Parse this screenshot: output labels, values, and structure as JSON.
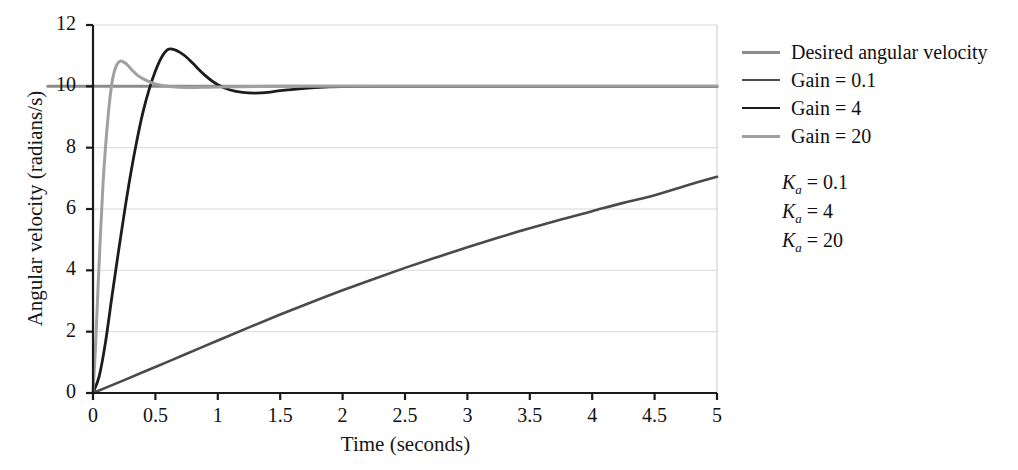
{
  "chart_data": {
    "type": "line",
    "title": "",
    "xlabel": "Time (seconds)",
    "ylabel": "Angular velocity (radians/s)",
    "xlim": [
      0,
      5
    ],
    "ylim": [
      0,
      12
    ],
    "xticks": [
      "0",
      "0.5",
      "1",
      "1.5",
      "2",
      "2.5",
      "3",
      "3.5",
      "4",
      "4.5",
      "5"
    ],
    "yticks": [
      "0",
      "2",
      "4",
      "6",
      "8",
      "10",
      "12"
    ],
    "grid": true,
    "grid_axis": "y",
    "legend_position": "right",
    "series": [
      {
        "name": "Desired angular velocity",
        "color": "#8c8c8c",
        "width": 3.0,
        "x": [
          0,
          0.01,
          5
        ],
        "values": [
          10,
          10,
          10
        ]
      },
      {
        "name": "Gain = 0.1",
        "color": "#4a4a4a",
        "width": 2.6,
        "x": [
          0,
          0.25,
          0.5,
          0.75,
          1,
          1.25,
          1.5,
          1.75,
          2,
          2.25,
          2.5,
          2.75,
          3,
          3.25,
          3.5,
          3.75,
          4,
          4.25,
          4.5,
          4.75,
          5
        ],
        "values": [
          0,
          0.42,
          0.85,
          1.28,
          1.71,
          2.14,
          2.56,
          2.96,
          3.35,
          3.72,
          4.08,
          4.42,
          4.75,
          5.07,
          5.37,
          5.66,
          5.93,
          6.2,
          6.45,
          6.76,
          7.05
        ]
      },
      {
        "name": "Gain = 4",
        "color": "#1c1c1c",
        "width": 2.8,
        "x": [
          0,
          0.05,
          0.1,
          0.15,
          0.2,
          0.25,
          0.3,
          0.35,
          0.4,
          0.45,
          0.5,
          0.55,
          0.6,
          0.65,
          0.7,
          0.75,
          0.8,
          0.9,
          1,
          1.1,
          1.2,
          1.3,
          1.4,
          1.5,
          1.6,
          1.75,
          2,
          2.5,
          3,
          4,
          5
        ],
        "values": [
          0,
          0.55,
          1.65,
          3.1,
          4.5,
          5.85,
          7.1,
          8.2,
          9.15,
          9.9,
          10.5,
          10.95,
          11.2,
          11.2,
          11.1,
          10.95,
          10.75,
          10.35,
          10.05,
          9.88,
          9.8,
          9.78,
          9.8,
          9.86,
          9.9,
          9.95,
          9.99,
          10.0,
          10.0,
          10.0,
          10.0
        ]
      },
      {
        "name": "Gain = 20",
        "color": "#a0a0a0",
        "width": 3.0,
        "x": [
          0,
          0.02,
          0.04,
          0.06,
          0.08,
          0.1,
          0.13,
          0.16,
          0.19,
          0.22,
          0.25,
          0.28,
          0.32,
          0.36,
          0.4,
          0.45,
          0.5,
          0.6,
          0.7,
          0.8,
          0.9,
          1.0,
          1.2,
          1.5,
          2,
          3,
          4,
          5
        ],
        "values": [
          0,
          1.5,
          3.4,
          5.2,
          6.8,
          8.0,
          9.4,
          10.3,
          10.7,
          10.82,
          10.78,
          10.68,
          10.5,
          10.35,
          10.25,
          10.15,
          10.08,
          10.0,
          9.97,
          9.96,
          9.97,
          9.98,
          9.99,
          10.0,
          10.0,
          10.0,
          10.0,
          10.0
        ]
      }
    ],
    "annotations": [
      {
        "label_sym": "K",
        "label_sub": "a",
        "label_eq": " = 0.1"
      },
      {
        "label_sym": "K",
        "label_sub": "a",
        "label_eq": " = 4"
      },
      {
        "label_sym": "K",
        "label_sub": "a",
        "label_eq": " = 20"
      }
    ]
  },
  "colors": {
    "axis": "#1a1a1a",
    "grid": "#d8d8d8",
    "frame": "#c9c9c9",
    "text": "#111111"
  }
}
